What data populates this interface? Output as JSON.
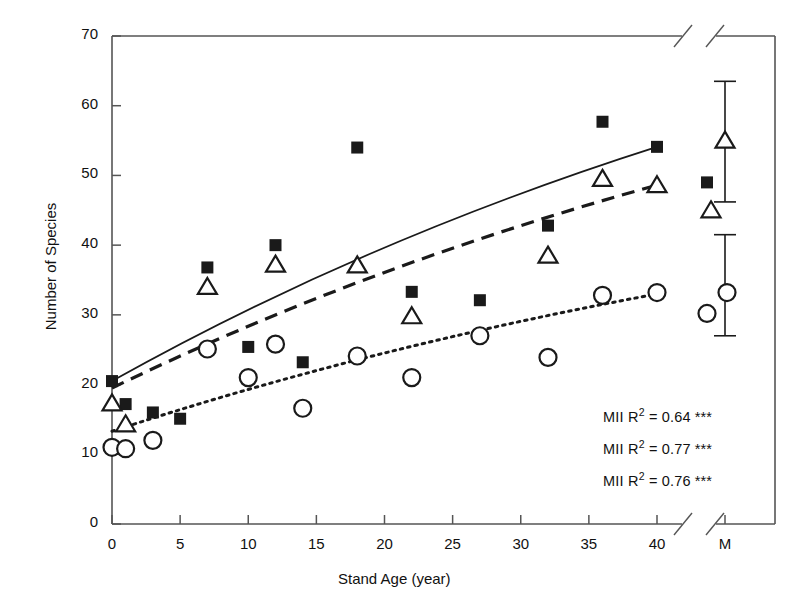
{
  "chart_data": {
    "type": "scatter",
    "title": "",
    "xlabel": "Stand Age (year)",
    "ylabel": "Number of Species",
    "xlim": [
      0,
      40
    ],
    "ylim": [
      0,
      70
    ],
    "xticks": [
      0,
      5,
      10,
      15,
      20,
      25,
      30,
      35,
      40
    ],
    "xtick_labels": [
      "0",
      "5",
      "10",
      "15",
      "20",
      "25",
      "30",
      "35",
      "40"
    ],
    "yticks": [
      0,
      10,
      20,
      30,
      40,
      50,
      60,
      70
    ],
    "ytick_labels": [
      "0",
      "10",
      "20",
      "30",
      "40",
      "50",
      "60",
      "70"
    ],
    "extra_xtick_label": "M",
    "axis_break": true,
    "grid": false,
    "legend_position": "none",
    "series": [
      {
        "name": "filled-square",
        "marker": "filled-square",
        "fit_line_style": "solid",
        "points": [
          {
            "x": 0,
            "y": 20.5
          },
          {
            "x": 1,
            "y": 17.2
          },
          {
            "x": 3,
            "y": 16.0
          },
          {
            "x": 5,
            "y": 15.1
          },
          {
            "x": 7,
            "y": 36.8
          },
          {
            "x": 10,
            "y": 25.4
          },
          {
            "x": 12,
            "y": 40.0
          },
          {
            "x": 14,
            "y": 23.2
          },
          {
            "x": 18,
            "y": 54.0
          },
          {
            "x": 22,
            "y": 33.3
          },
          {
            "x": 27,
            "y": 32.1
          },
          {
            "x": 32,
            "y": 42.8
          },
          {
            "x": 36,
            "y": 57.7
          },
          {
            "x": 40,
            "y": 54.1
          }
        ]
      },
      {
        "name": "open-triangle",
        "marker": "open-triangle",
        "fit_line_style": "dashed",
        "points": [
          {
            "x": 0,
            "y": 17.3
          },
          {
            "x": 1,
            "y": 14.3
          },
          {
            "x": 7,
            "y": 34.0
          },
          {
            "x": 12,
            "y": 37.2
          },
          {
            "x": 18,
            "y": 37.1
          },
          {
            "x": 22,
            "y": 29.8
          },
          {
            "x": 32,
            "y": 38.5
          },
          {
            "x": 36,
            "y": 49.5
          },
          {
            "x": 40,
            "y": 48.6
          }
        ]
      },
      {
        "name": "open-circle",
        "marker": "open-circle",
        "fit_line_style": "dotted",
        "points": [
          {
            "x": 0,
            "y": 11.0
          },
          {
            "x": 1,
            "y": 10.8
          },
          {
            "x": 3,
            "y": 12.0
          },
          {
            "x": 7,
            "y": 25.1
          },
          {
            "x": 10,
            "y": 21.0
          },
          {
            "x": 12,
            "y": 25.8
          },
          {
            "x": 14,
            "y": 16.6
          },
          {
            "x": 18,
            "y": 24.1
          },
          {
            "x": 22,
            "y": 21.0
          },
          {
            "x": 27,
            "y": 27.0
          },
          {
            "x": 32,
            "y": 23.9
          },
          {
            "x": 36,
            "y": 32.8
          },
          {
            "x": 40,
            "y": 33.2
          }
        ]
      }
    ],
    "fit_lines": [
      {
        "style": "solid",
        "x0": 0,
        "y0": 20.5,
        "x1": 40,
        "y1": 54.1,
        "curved": true
      },
      {
        "style": "dashed",
        "x0": 0,
        "y0": 19.5,
        "x1": 40,
        "y1": 48.6,
        "curved": true
      },
      {
        "style": "dotted",
        "x0": 0,
        "y0": 13.3,
        "x1": 40,
        "y1": 33.0,
        "curved": true
      }
    ],
    "mature_stand_group": {
      "x_label": "M",
      "points": [
        {
          "marker": "open-triangle",
          "y": 55.0
        },
        {
          "marker": "filled-square",
          "y": 49.0
        },
        {
          "marker": "open-triangle",
          "y": 45.0
        },
        {
          "marker": "open-circle",
          "y": 33.2
        },
        {
          "marker": "open-circle",
          "y": 30.2
        }
      ],
      "error_bars": [
        {
          "center": 54.8,
          "upper": 63.5,
          "lower": 46.2
        },
        {
          "center": 33.5,
          "upper": 41.5,
          "lower": 27.0
        }
      ]
    },
    "annotations": [
      {
        "id": "stat-0",
        "prefix": "MII R",
        "sup": "2",
        "equals": " = ",
        "value": "0.64",
        "stars": " ***"
      },
      {
        "id": "stat-1",
        "prefix": "MII R",
        "sup": "2",
        "equals": " = ",
        "value": "0.77",
        "stars": " ***"
      },
      {
        "id": "stat-2",
        "prefix": "MII R",
        "sup": "2",
        "equals": " = ",
        "value": "0.76",
        "stars": " ***"
      }
    ]
  },
  "axes": {
    "x_title": "Stand Age (year)",
    "y_title": "Number of Species"
  },
  "ticks": {
    "x": [
      "0",
      "5",
      "10",
      "15",
      "20",
      "25",
      "30",
      "35",
      "40",
      "M"
    ],
    "y": [
      "70",
      "60",
      "50",
      "40",
      "30",
      "20",
      "10",
      "0"
    ]
  },
  "stats": {
    "line0": {
      "label": "MII R",
      "exp": "2",
      "eq": " = 0.64",
      "stars": " ***"
    },
    "line1": {
      "label": "MII R",
      "exp": "2",
      "eq": " = 0.77",
      "stars": " ***"
    },
    "line2": {
      "label": "MII R",
      "exp": "2",
      "eq": " = 0.76",
      "stars": " ***"
    }
  },
  "colors": {
    "ink": "#1a1a1a",
    "axis": "#555555",
    "background": "#ffffff"
  }
}
